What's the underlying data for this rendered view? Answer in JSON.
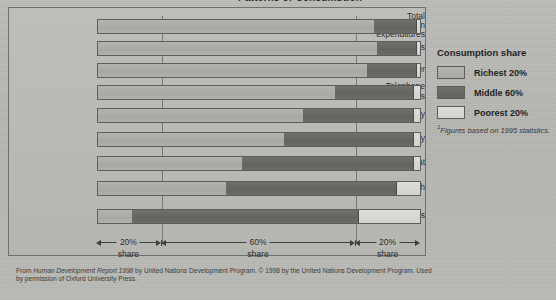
{
  "title": "Patterns of Consumption",
  "legend": {
    "title": "Consumption share",
    "items": [
      {
        "label": "Richest 20%",
        "key": "rich",
        "color": "#aeaea9",
        "swatch_name": "legend-swatch-richest"
      },
      {
        "label": "Middle 60%",
        "key": "mid",
        "color": "#67675f",
        "swatch_name": "legend-swatch-middle"
      },
      {
        "label": "Poorest 20%",
        "key": "poor",
        "color": "#d8d8d4",
        "swatch_name": "legend-swatch-poorest"
      }
    ]
  },
  "footnote": {
    "marker": "1",
    "text": "Figures based on 1995 statistics."
  },
  "axis": {
    "spans": [
      {
        "pct": "20%",
        "share": "share"
      },
      {
        "pct": "60%",
        "share": "share"
      },
      {
        "pct": "20%",
        "share": "share"
      }
    ]
  },
  "source": {
    "line1_a": "From ",
    "line1_italic": "Human Development Report 1998",
    "line1_b": " by United Nations Development Program. © 1998 by the United Nations Development Program. Used by permission",
    "line2": "of Oxford University Press."
  },
  "chart_data": {
    "type": "bar",
    "orientation": "horizontal",
    "stacked": true,
    "title": "Patterns of Consumption",
    "xlabel": "",
    "ylabel": "",
    "xlim": [
      0,
      100
    ],
    "grid": true,
    "gridlines": [
      20,
      80
    ],
    "legend_position": "right",
    "units": "percent of world total consumption",
    "categories": [
      "Total consumption expenditures",
      "Cars",
      "Paper",
      "Telephone connections",
      "Electricity",
      "Total energy",
      "Meat",
      "Fish",
      "Cereals"
    ],
    "series": [
      {
        "name": "Richest 20%",
        "values": [
          86,
          87,
          84,
          74,
          64,
          58,
          45,
          40,
          11
        ]
      },
      {
        "name": "Middle 60%",
        "values": [
          13,
          12,
          15,
          24,
          34,
          40,
          53,
          53,
          70
        ]
      },
      {
        "name": "Poorest 20%",
        "values": [
          1,
          1,
          1,
          2,
          2,
          2,
          2,
          7,
          19
        ]
      }
    ]
  },
  "rows": [
    {
      "label": "Total\nconsumption\nexpenditures",
      "label_lines": [
        "Total",
        "consumption",
        "expenditures"
      ],
      "rich": 86,
      "mid": 13,
      "poor": 1
    },
    {
      "label": "Cars",
      "label_lines": [
        "Cars"
      ],
      "rich": 87,
      "mid": 12,
      "poor": 1
    },
    {
      "label": "Paper",
      "label_lines": [
        "Paper"
      ],
      "rich": 84,
      "mid": 15,
      "poor": 1
    },
    {
      "label": "Telephone\nconnections",
      "label_lines": [
        "Telephone",
        "connections"
      ],
      "rich": 74,
      "mid": 24,
      "poor": 2
    },
    {
      "label": "Electricity",
      "label_lines": [
        "Electricity"
      ],
      "rich": 64,
      "mid": 34,
      "poor": 2
    },
    {
      "label": "Total energy",
      "label_lines": [
        "Total energy"
      ],
      "rich": 58,
      "mid": 40,
      "poor": 2
    },
    {
      "label": "Meat",
      "label_lines": [
        "Meat"
      ],
      "rich": 45,
      "mid": 53,
      "poor": 2
    },
    {
      "label": "Fish",
      "label_lines": [
        "Fish"
      ],
      "rich": 40,
      "mid": 53,
      "poor": 7
    },
    {
      "label": "Cereals",
      "label_lines": [
        "Cereals"
      ],
      "rich": 11,
      "mid": 70,
      "poor": 19
    }
  ]
}
